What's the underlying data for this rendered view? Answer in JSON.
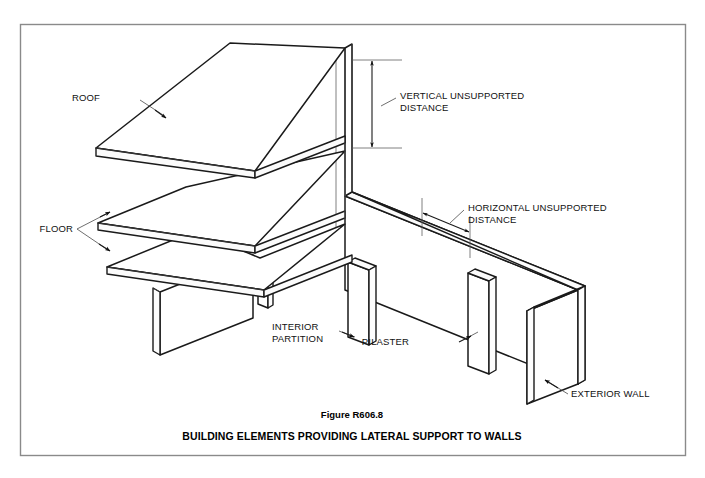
{
  "figure": {
    "border_color": "#8a8a8a",
    "background": "#ffffff",
    "line_color": "#1a1a1a"
  },
  "labels": {
    "roof": "ROOF",
    "floor": "FLOOR",
    "vertical_unsupported_line1": "VERTICAL UNSUPPORTED",
    "vertical_unsupported_line2": "DISTANCE",
    "horizontal_unsupported_line1": "HORIZONTAL UNSUPPORTED",
    "horizontal_unsupported_line2": "DISTANCE",
    "interior_partition_line1": "INTERIOR",
    "interior_partition_line2": "PARTITION",
    "pilaster": "PILASTER",
    "exterior_wall": "EXTERIOR WALL"
  },
  "caption": {
    "figure_number": "Figure R606.8",
    "title": "BUILDING ELEMENTS PROVIDING LATERAL SUPPORT TO WALLS"
  }
}
